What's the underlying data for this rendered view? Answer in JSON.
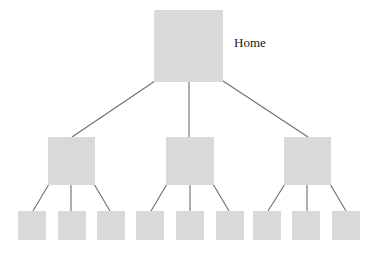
{
  "diagram": {
    "type": "hierarchy-tree",
    "colors": {
      "node_fill": "#d9d9d9",
      "edge_stroke": "#6e6e6e",
      "label_text": "#222222",
      "background": "#ffffff"
    },
    "root": {
      "label": "Home",
      "box": {
        "x": 154,
        "y": 10,
        "w": 69,
        "h": 72
      },
      "label_pos": {
        "x": 234,
        "y": 36
      }
    },
    "level1": [
      {
        "box": {
          "x": 48,
          "y": 137,
          "w": 47,
          "h": 48
        }
      },
      {
        "box": {
          "x": 166,
          "y": 137,
          "w": 48,
          "h": 48
        }
      },
      {
        "box": {
          "x": 284,
          "y": 137,
          "w": 47,
          "h": 48
        }
      }
    ],
    "level2": [
      {
        "parent": 0,
        "box": {
          "x": 18,
          "y": 211,
          "w": 28,
          "h": 29
        }
      },
      {
        "parent": 0,
        "box": {
          "x": 58,
          "y": 211,
          "w": 28,
          "h": 29
        }
      },
      {
        "parent": 0,
        "box": {
          "x": 97,
          "y": 211,
          "w": 28,
          "h": 29
        }
      },
      {
        "parent": 1,
        "box": {
          "x": 136,
          "y": 211,
          "w": 28,
          "h": 29
        }
      },
      {
        "parent": 1,
        "box": {
          "x": 176,
          "y": 211,
          "w": 28,
          "h": 29
        }
      },
      {
        "parent": 1,
        "box": {
          "x": 216,
          "y": 211,
          "w": 28,
          "h": 29
        }
      },
      {
        "parent": 2,
        "box": {
          "x": 253,
          "y": 211,
          "w": 28,
          "h": 29
        }
      },
      {
        "parent": 2,
        "box": {
          "x": 292,
          "y": 211,
          "w": 28,
          "h": 29
        }
      },
      {
        "parent": 2,
        "box": {
          "x": 332,
          "y": 211,
          "w": 28,
          "h": 29
        }
      }
    ],
    "edges": [
      {
        "from": "root",
        "to": "level1.0",
        "x1": 155,
        "y1": 81,
        "x2": 72,
        "y2": 137
      },
      {
        "from": "root",
        "to": "level1.1",
        "x1": 189,
        "y1": 82,
        "x2": 189,
        "y2": 137
      },
      {
        "from": "root",
        "to": "level1.2",
        "x1": 223,
        "y1": 81,
        "x2": 308,
        "y2": 137
      },
      {
        "from": "level1.0",
        "to": "level2.0",
        "x1": 49,
        "y1": 184,
        "x2": 33,
        "y2": 211
      },
      {
        "from": "level1.0",
        "to": "level2.1",
        "x1": 71,
        "y1": 185,
        "x2": 71,
        "y2": 211
      },
      {
        "from": "level1.0",
        "to": "level2.2",
        "x1": 94,
        "y1": 184,
        "x2": 110,
        "y2": 211
      },
      {
        "from": "level1.1",
        "to": "level2.3",
        "x1": 167,
        "y1": 184,
        "x2": 151,
        "y2": 211
      },
      {
        "from": "level1.1",
        "to": "level2.4",
        "x1": 190,
        "y1": 185,
        "x2": 190,
        "y2": 211
      },
      {
        "from": "level1.1",
        "to": "level2.5",
        "x1": 213,
        "y1": 184,
        "x2": 229,
        "y2": 211
      },
      {
        "from": "level1.2",
        "to": "level2.6",
        "x1": 285,
        "y1": 184,
        "x2": 268,
        "y2": 211
      },
      {
        "from": "level1.2",
        "to": "level2.7",
        "x1": 307,
        "y1": 185,
        "x2": 307,
        "y2": 211
      },
      {
        "from": "level1.2",
        "to": "level2.8",
        "x1": 330,
        "y1": 184,
        "x2": 346,
        "y2": 211
      }
    ]
  }
}
